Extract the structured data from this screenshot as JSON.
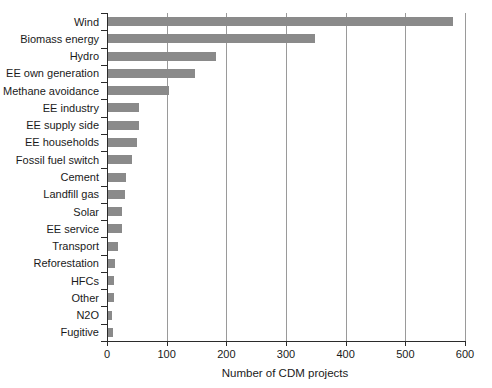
{
  "chart_data": {
    "type": "bar",
    "orientation": "horizontal",
    "title": "",
    "xlabel": "Number of CDM projects",
    "ylabel": "",
    "xlim": [
      0,
      600
    ],
    "xticks": [
      0,
      100,
      200,
      300,
      400,
      500,
      600
    ],
    "xtick_labels": [
      "0",
      "100",
      "200",
      "300",
      "400",
      "500",
      "600"
    ],
    "grid": "vertical",
    "legend": "none",
    "bar_color": "#8a8a8a",
    "categories": [
      "Wind",
      "Biomass energy",
      "Hydro",
      "EE own generation",
      "Methane avoidance",
      "EE industry",
      "EE supply side",
      "EE households",
      "Fossil fuel switch",
      "Cement",
      "Landfill gas",
      "Solar",
      "EE service",
      "Transport",
      "Reforestation",
      "HFCs",
      "Other",
      "N2O",
      "Fugitive"
    ],
    "values": [
      580,
      348,
      183,
      147,
      104,
      54,
      53,
      50,
      42,
      32,
      31,
      25,
      25,
      19,
      14,
      12,
      12,
      8,
      10
    ]
  }
}
